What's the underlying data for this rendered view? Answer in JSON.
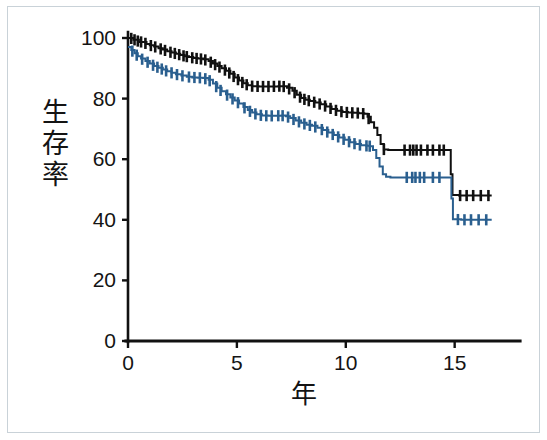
{
  "figure": {
    "kind": "kaplan-meier-survival-plot",
    "border_color": "#c9d2d8",
    "background": "#ffffff"
  },
  "chart_data": {
    "type": "line",
    "title": "",
    "subtitle": "",
    "xlabel": "年",
    "ylabel": "生存率",
    "xlim": [
      0,
      18
    ],
    "ylim": [
      0,
      105
    ],
    "xticks": [
      0,
      5,
      10,
      15
    ],
    "xtick_labels": [
      "0",
      "5",
      "10",
      "15"
    ],
    "yticks": [
      0,
      20,
      40,
      60,
      80,
      100
    ],
    "ytick_labels": [
      "0",
      "20",
      "40",
      "60",
      "80",
      "100"
    ],
    "grid": false,
    "legend": "none",
    "axis_color": "#111111",
    "series": [
      {
        "name": "black-curve",
        "color": "#101010",
        "line_width": 2.0,
        "marker": "censor-tick",
        "final_value": 48,
        "points": [
          [
            0.0,
            100.0
          ],
          [
            0.12,
            100.0
          ],
          [
            0.25,
            99.4
          ],
          [
            0.38,
            99.4
          ],
          [
            0.5,
            98.7
          ],
          [
            0.7,
            98.7
          ],
          [
            0.85,
            98.0
          ],
          [
            1.0,
            97.6
          ],
          [
            1.2,
            97.2
          ],
          [
            1.4,
            96.6
          ],
          [
            1.6,
            96.2
          ],
          [
            1.8,
            95.6
          ],
          [
            2.0,
            95.2
          ],
          [
            2.2,
            94.8
          ],
          [
            2.4,
            94.4
          ],
          [
            2.6,
            94.0
          ],
          [
            2.8,
            93.7
          ],
          [
            3.0,
            93.4
          ],
          [
            3.2,
            93.2
          ],
          [
            3.45,
            93.0
          ],
          [
            3.7,
            92.4
          ],
          [
            3.9,
            91.6
          ],
          [
            4.1,
            90.8
          ],
          [
            4.3,
            90.0
          ],
          [
            4.5,
            89.2
          ],
          [
            4.7,
            88.2
          ],
          [
            4.9,
            87.0
          ],
          [
            5.1,
            86.0
          ],
          [
            5.3,
            85.1
          ],
          [
            5.5,
            84.4
          ],
          [
            5.7,
            84.1
          ],
          [
            6.0,
            84.0
          ],
          [
            6.3,
            84.0
          ],
          [
            6.6,
            84.0
          ],
          [
            6.9,
            84.1
          ],
          [
            7.1,
            84.1
          ],
          [
            7.3,
            83.6
          ],
          [
            7.55,
            82.6
          ],
          [
            7.75,
            81.3
          ],
          [
            7.95,
            80.2
          ],
          [
            8.15,
            79.6
          ],
          [
            8.35,
            79.2
          ],
          [
            8.6,
            78.7
          ],
          [
            8.85,
            78.1
          ],
          [
            9.1,
            77.4
          ],
          [
            9.35,
            76.6
          ],
          [
            9.6,
            76.0
          ],
          [
            9.85,
            75.6
          ],
          [
            10.1,
            75.4
          ],
          [
            10.35,
            75.3
          ],
          [
            10.6,
            75.2
          ],
          [
            10.85,
            75.0
          ],
          [
            11.0,
            74.0
          ],
          [
            11.15,
            72.2
          ],
          [
            11.3,
            70.4
          ],
          [
            11.45,
            68.0
          ],
          [
            11.6,
            65.0
          ],
          [
            11.75,
            63.2
          ],
          [
            11.95,
            63.0
          ],
          [
            12.4,
            63.0
          ],
          [
            12.9,
            63.0
          ],
          [
            13.3,
            63.0
          ],
          [
            13.8,
            63.0
          ],
          [
            14.3,
            63.0
          ],
          [
            14.75,
            63.0
          ],
          [
            14.82,
            55.0
          ],
          [
            14.9,
            48.2
          ],
          [
            15.2,
            48.0
          ],
          [
            15.7,
            48.0
          ],
          [
            16.2,
            48.0
          ],
          [
            16.7,
            48.0
          ]
        ],
        "censor_marks_x": [
          0.15,
          0.3,
          0.45,
          0.6,
          0.8,
          1.05,
          1.25,
          1.5,
          1.7,
          1.95,
          2.15,
          2.35,
          2.55,
          2.7,
          2.95,
          3.15,
          3.35,
          3.55,
          3.8,
          4.0,
          4.2,
          4.45,
          4.65,
          4.85,
          5.05,
          5.25,
          5.45,
          5.7,
          5.95,
          6.2,
          6.45,
          6.7,
          6.95,
          7.15,
          7.4,
          7.65,
          7.9,
          8.1,
          8.3,
          8.55,
          8.8,
          9.05,
          9.3,
          9.55,
          9.8,
          10.05,
          10.3,
          10.55,
          10.8,
          11.05,
          11.75,
          12.7,
          12.95,
          13.1,
          13.25,
          13.45,
          13.75,
          14.0,
          14.3,
          14.5,
          15.25,
          15.55,
          15.85,
          16.2,
          16.55
        ]
      },
      {
        "name": "blue-curve",
        "color": "#2a5f8f",
        "line_width": 2.0,
        "marker": "censor-tick",
        "final_value": 40,
        "points": [
          [
            0.0,
            97.0
          ],
          [
            0.15,
            96.0
          ],
          [
            0.3,
            95.0
          ],
          [
            0.45,
            94.0
          ],
          [
            0.6,
            93.2
          ],
          [
            0.8,
            92.4
          ],
          [
            1.0,
            91.6
          ],
          [
            1.2,
            90.8
          ],
          [
            1.4,
            90.2
          ],
          [
            1.6,
            89.6
          ],
          [
            1.8,
            89.0
          ],
          [
            2.0,
            88.5
          ],
          [
            2.2,
            88.0
          ],
          [
            2.45,
            87.6
          ],
          [
            2.7,
            87.2
          ],
          [
            2.95,
            87.0
          ],
          [
            3.2,
            86.9
          ],
          [
            3.45,
            86.8
          ],
          [
            3.7,
            86.2
          ],
          [
            3.9,
            85.0
          ],
          [
            4.1,
            83.6
          ],
          [
            4.3,
            82.4
          ],
          [
            4.5,
            81.4
          ],
          [
            4.7,
            80.4
          ],
          [
            4.9,
            79.4
          ],
          [
            5.1,
            78.4
          ],
          [
            5.3,
            77.2
          ],
          [
            5.5,
            76.2
          ],
          [
            5.7,
            75.4
          ],
          [
            5.9,
            74.8
          ],
          [
            6.15,
            74.4
          ],
          [
            6.45,
            74.3
          ],
          [
            6.75,
            74.3
          ],
          [
            7.05,
            74.4
          ],
          [
            7.25,
            74.2
          ],
          [
            7.45,
            73.6
          ],
          [
            7.7,
            72.8
          ],
          [
            7.95,
            72.0
          ],
          [
            8.2,
            71.4
          ],
          [
            8.45,
            71.0
          ],
          [
            8.7,
            70.4
          ],
          [
            8.95,
            69.6
          ],
          [
            9.2,
            68.8
          ],
          [
            9.45,
            68.0
          ],
          [
            9.7,
            67.2
          ],
          [
            9.95,
            66.4
          ],
          [
            10.2,
            65.6
          ],
          [
            10.45,
            65.0
          ],
          [
            10.7,
            64.6
          ],
          [
            10.95,
            64.4
          ],
          [
            11.1,
            64.3
          ],
          [
            11.25,
            63.0
          ],
          [
            11.4,
            60.4
          ],
          [
            11.55,
            57.6
          ],
          [
            11.7,
            55.0
          ],
          [
            11.85,
            54.2
          ],
          [
            12.05,
            54.0
          ],
          [
            12.5,
            54.0
          ],
          [
            13.0,
            54.0
          ],
          [
            13.5,
            54.0
          ],
          [
            14.0,
            54.0
          ],
          [
            14.5,
            54.0
          ],
          [
            14.78,
            54.0
          ],
          [
            14.85,
            47.0
          ],
          [
            14.92,
            40.2
          ],
          [
            15.3,
            40.0
          ],
          [
            15.8,
            40.0
          ],
          [
            16.3,
            40.0
          ],
          [
            16.7,
            40.0
          ]
        ],
        "censor_marks_x": [
          0.2,
          0.4,
          0.65,
          0.9,
          1.15,
          1.35,
          1.55,
          1.75,
          2.0,
          2.25,
          2.5,
          2.8,
          3.05,
          3.3,
          3.55,
          3.75,
          4.05,
          4.25,
          4.55,
          4.8,
          5.05,
          5.35,
          5.6,
          5.85,
          6.1,
          6.35,
          6.6,
          6.9,
          7.1,
          7.35,
          7.6,
          7.85,
          8.1,
          8.35,
          8.6,
          8.9,
          9.15,
          9.4,
          9.65,
          9.9,
          10.15,
          10.4,
          10.65,
          10.95,
          11.1,
          12.8,
          13.05,
          13.2,
          13.4,
          13.6,
          14.0,
          14.3,
          15.15,
          15.45,
          15.75,
          16.1,
          16.45
        ]
      }
    ]
  }
}
